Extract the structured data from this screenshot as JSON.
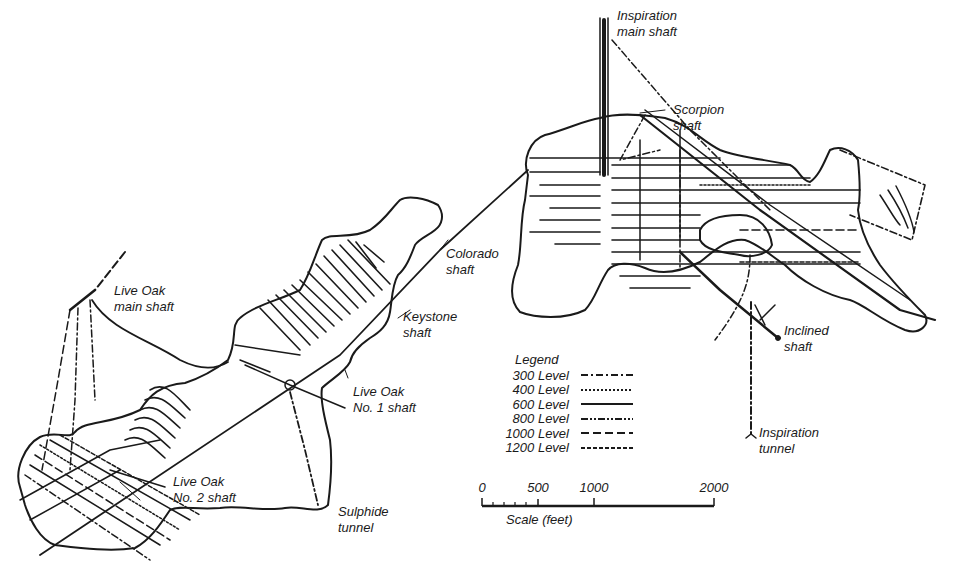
{
  "diagram": {
    "type": "mine workings plan map",
    "ink_color": "#1a1a1a",
    "background": "#ffffff"
  },
  "labels": {
    "inspiration_main_shaft": "Inspiration\nmain shaft",
    "scorpion_shaft": "Scorpion\nshaft",
    "colorado_shaft": "Colorado\nshaft",
    "keystone_shaft": "Keystone\nshaft",
    "live_oak_main_shaft": "Live Oak\nmain shaft",
    "live_oak_no1_shaft": "Live Oak\nNo. 1 shaft",
    "live_oak_no2_shaft": "Live Oak\nNo. 2 shaft",
    "sulphide_tunnel": "Sulphide\ntunnel",
    "inclined_shaft": "Inclined\nshaft",
    "inspiration_tunnel": "Inspiration\ntunnel"
  },
  "legend": {
    "title": "Legend",
    "items": [
      {
        "label": "300 Level",
        "style": "dash-dot",
        "dasharray": "7 3 2 3"
      },
      {
        "label": "400 Level",
        "style": "dotted",
        "dasharray": "2 2"
      },
      {
        "label": "600 Level",
        "style": "solid",
        "dasharray": ""
      },
      {
        "label": "800 Level",
        "style": "dash-dot-dot",
        "dasharray": "7 2 2 2 2 2"
      },
      {
        "label": "1000 Level",
        "style": "long-dash",
        "dasharray": "8 4"
      },
      {
        "label": "1200 Level",
        "style": "short-dash",
        "dasharray": "4 2"
      }
    ]
  },
  "scale_bar": {
    "title": "Scale (feet)",
    "ticks": [
      {
        "value": "0",
        "pos": 0
      },
      {
        "value": "500",
        "pos": 56
      },
      {
        "value": "1000",
        "pos": 112
      },
      {
        "value": "2000",
        "pos": 232
      }
    ]
  }
}
